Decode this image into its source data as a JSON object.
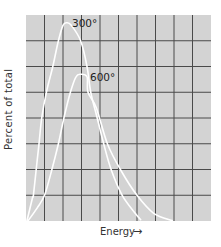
{
  "chart_data": {
    "type": "line",
    "title": "",
    "xlabel": "Energy",
    "xlabel_arrow": "→",
    "ylabel": "Percent of total",
    "grid": true,
    "grid_columns": 10,
    "grid_rows": 8,
    "x_ticks": [],
    "y_ticks": [],
    "xlim": [
      0,
      10
    ],
    "ylim": [
      0,
      8
    ],
    "legend": null,
    "colors": {
      "plot_background": "#d3d3d3",
      "grid_lines": "#4a4a4a",
      "curves": "#ffffff"
    },
    "series": [
      {
        "name": "300°",
        "label": "300°",
        "points": [
          [
            0.05,
            0.0
          ],
          [
            0.35,
            0.9
          ],
          [
            0.4,
            1.0
          ],
          [
            0.55,
            2.0
          ],
          [
            0.7,
            3.0
          ],
          [
            0.85,
            4.0
          ],
          [
            1.1,
            5.0
          ],
          [
            1.45,
            6.0
          ],
          [
            1.75,
            7.0
          ],
          [
            2.0,
            7.6
          ],
          [
            2.2,
            7.7
          ],
          [
            2.45,
            7.6
          ],
          [
            2.95,
            7.0
          ],
          [
            3.3,
            6.0
          ],
          [
            3.5,
            5.0
          ],
          [
            3.85,
            4.0
          ],
          [
            4.2,
            3.0
          ],
          [
            4.6,
            2.0
          ],
          [
            5.2,
            1.0
          ],
          [
            5.9,
            0.3
          ],
          [
            6.2,
            0.05
          ]
        ]
      },
      {
        "name": "600°",
        "label": "600°",
        "points": [
          [
            0.1,
            0.0
          ],
          [
            0.6,
            0.5
          ],
          [
            1.0,
            1.0
          ],
          [
            1.4,
            2.0
          ],
          [
            1.75,
            3.0
          ],
          [
            2.05,
            4.0
          ],
          [
            2.4,
            5.0
          ],
          [
            2.7,
            5.6
          ],
          [
            2.95,
            5.7
          ],
          [
            3.3,
            5.6
          ],
          [
            3.35,
            5.0
          ],
          [
            3.8,
            4.4
          ],
          [
            4.4,
            3.0
          ],
          [
            5.1,
            2.0
          ],
          [
            6.0,
            1.0
          ],
          [
            6.9,
            0.3
          ],
          [
            7.9,
            0.02
          ]
        ]
      }
    ],
    "annotations": [
      {
        "text": "300°",
        "near_series": "300°",
        "position": "right of peak"
      },
      {
        "text": "600°",
        "near_series": "600°",
        "position": "right of peak"
      }
    ]
  },
  "labels": {
    "ylabel": "Percent of total",
    "xlabel": "Energy",
    "xarrow": "→",
    "curve_300": "300°",
    "curve_600": "600°"
  }
}
